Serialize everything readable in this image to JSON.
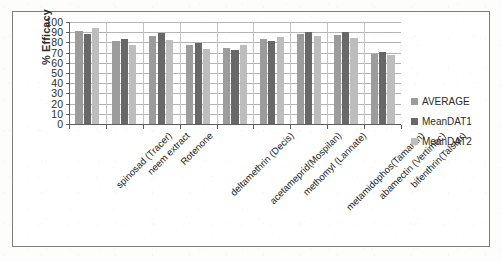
{
  "chart_data": {
    "type": "bar",
    "title": "",
    "subtitle": "",
    "xlabel": "",
    "ylabel": "% Efficacy",
    "ylim": [
      0,
      100
    ],
    "ytick_step": 10,
    "ytick_labels": [
      "100",
      "90",
      "80",
      "70",
      "60",
      "50",
      "40",
      "30",
      "20",
      "10",
      "0"
    ],
    "grid": true,
    "legend_position": "right",
    "categories": [
      "spinosad (Tracer)",
      "neem extract",
      "Rotenone",
      "deltamethrin (Decis)",
      "acetameprid(Mospilan)",
      "methomyl (Lannate)",
      "metamidophos(Tamaran)",
      "abamectin (Vertimec)",
      "bifenthrin(Talstar)"
    ],
    "series": [
      {
        "name": "AVERAGE",
        "color": "#9c9c9c",
        "values": [
          91,
          81,
          86,
          77,
          75,
          83,
          88,
          87,
          69
        ]
      },
      {
        "name": "MeanDAT1",
        "color": "#686868",
        "values": [
          88,
          83,
          89,
          79,
          73,
          81,
          90,
          90,
          71
        ]
      },
      {
        "name": "MeanDAT2",
        "color": "#bdbdbd",
        "values": [
          94,
          77,
          82,
          74,
          77,
          85,
          86,
          84,
          68
        ]
      }
    ]
  },
  "legend": {
    "items": [
      {
        "label": "AVERAGE",
        "color": "#9c9c9c"
      },
      {
        "label": "MeanDAT1",
        "color": "#686868"
      },
      {
        "label": "MeanDAT2",
        "color": "#bdbdbd"
      }
    ]
  },
  "axes": {
    "y_title": "% Efficacy"
  }
}
